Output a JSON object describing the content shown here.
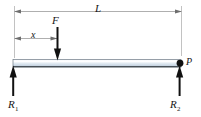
{
  "figure": {
    "type": "engineering-free-body-diagram"
  },
  "labels": {
    "span_length": "L",
    "load_position": "x",
    "applied_load": "F",
    "point_P": "P",
    "reaction_left_base": "R",
    "reaction_left_sub": "1",
    "reaction_right_base": "R",
    "reaction_right_sub": "2"
  },
  "colors": {
    "beam_fill_light": "#eef3f8",
    "beam_fill_mid": "#c8d6e4",
    "beam_edge": "#5d6a78",
    "beam_bottom_edge": "#2b3036",
    "arrow": "#111111",
    "dimension_line": "#8c8c8c",
    "extension_line": "#a8a8a8",
    "text": "#161616"
  },
  "geometry": {
    "beam_left_x": 13,
    "beam_right_x": 181,
    "beam_top_y": 60,
    "beam_bottom_y": 67,
    "dim_L_y": 11,
    "dim_x_y": 38,
    "load_x": 57.5,
    "load_arrow_top_y": 27,
    "reaction_arrow_bottom_y": 96,
    "reaction_arrow_top_y": 66,
    "point_P_x": 180,
    "point_P_y": 63
  }
}
